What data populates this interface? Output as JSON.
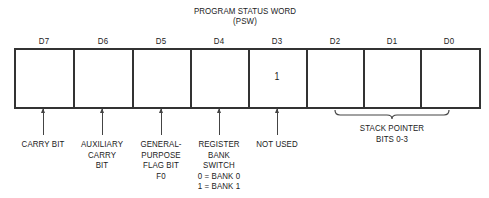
{
  "title": "PROGRAM STATUS WORD",
  "subtitle": "(PSW)",
  "bits": [
    {
      "label": "D7",
      "value": ""
    },
    {
      "label": "D6",
      "value": ""
    },
    {
      "label": "D5",
      "value": ""
    },
    {
      "label": "D4",
      "value": ""
    },
    {
      "label": "D3",
      "value": "1"
    },
    {
      "label": "D2",
      "value": ""
    },
    {
      "label": "D1",
      "value": ""
    },
    {
      "label": "D0",
      "value": ""
    }
  ],
  "annotations": {
    "d7": [
      "CARRY BIT"
    ],
    "d6": [
      "AUXILIARY",
      "CARRY",
      "BIT"
    ],
    "d5": [
      "GENERAL-",
      "PURPOSE",
      "FLAG BIT",
      "F0"
    ],
    "d4": [
      "REGISTER",
      "BANK",
      "SWITCH",
      "0 = BANK 0",
      "1 = BANK 1"
    ],
    "d3": [
      "NOT USED"
    ],
    "d2_d0": [
      "STACK POINTER",
      "BITS 0-3"
    ]
  }
}
